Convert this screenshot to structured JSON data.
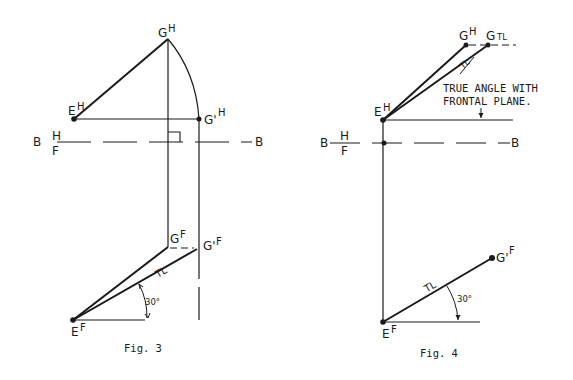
{
  "figures": [
    {
      "caption": "Fig. 3",
      "labels": {
        "g_h": "G",
        "g_h_sup": "H",
        "e_h": "E",
        "e_h_sup": "H",
        "gp_h": "G'",
        "gp_h_sup": "H",
        "b_left": "B",
        "b_right": "B",
        "fold_top": "H",
        "fold_bottom": "F",
        "g_f": "G",
        "g_f_sup": "F",
        "gp_f": "G'",
        "gp_f_sup": "F",
        "e_f": "E",
        "e_f_sup": "F",
        "tl": "TL",
        "angle": "30°"
      }
    },
    {
      "caption": "Fig. 4",
      "labels": {
        "g_h": "G",
        "g_h_sup": "H",
        "g_tl": "G",
        "g_tl_sub": "TL",
        "e_h": "E",
        "e_h_sup": "H",
        "tl_top": "TL",
        "note_line1": "TRUE ANGLE WITH",
        "note_line2": "FRONTAL PLANE.",
        "b_left": "B",
        "b_right": "B",
        "fold_top": "H",
        "fold_bottom": "F",
        "gp_f": "G'",
        "gp_f_sup": "F",
        "e_f": "E",
        "e_f_sup": "F",
        "tl": "TL",
        "angle": "30°"
      }
    }
  ],
  "colors": {
    "ink": "#1a1a1a",
    "background": "#ffffff"
  }
}
